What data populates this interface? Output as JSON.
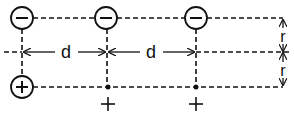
{
  "diagram": {
    "colors": {
      "stroke": "#111111",
      "background": "#ffffff"
    },
    "negative_charges": [
      {
        "symbol": "−",
        "x": 22,
        "y": 18,
        "circled": true
      },
      {
        "symbol": "−",
        "x": 106,
        "y": 18,
        "circled": true
      },
      {
        "symbol": "−",
        "x": 196,
        "y": 18,
        "circled": true
      }
    ],
    "positive_charges": [
      {
        "symbol": "+",
        "x": 22,
        "y": 87,
        "circled": true
      },
      {
        "symbol": "+",
        "x": 108,
        "y": 87,
        "circled": false,
        "label_y": 106
      },
      {
        "symbol": "+",
        "x": 196,
        "y": 87,
        "circled": false,
        "label_y": 106
      }
    ],
    "labels": {
      "spacing_1": "d",
      "spacing_2": "d",
      "half_gap_top": "r",
      "half_gap_bottom": "r",
      "plus_label_1": "+",
      "plus_label_2": "+",
      "circle_minus_1": "−",
      "circle_minus_2": "−",
      "circle_minus_3": "−",
      "circle_plus_1": "+"
    }
  }
}
